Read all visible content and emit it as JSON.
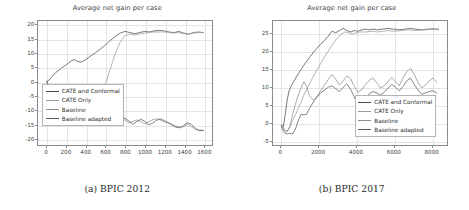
{
  "figure": {
    "background": "#ffffff",
    "subfigures": [
      {
        "caption": "(a) BPIC 2012",
        "chart_data": {
          "type": "line",
          "title": "Average net gain per case",
          "xlabel": "",
          "ylabel": "",
          "xlim": [
            -90,
            1690
          ],
          "ylim": [
            -22.5,
            21.5
          ],
          "grid": true,
          "legend_position": "lower left",
          "xticks": [
            0,
            200,
            400,
            600,
            800,
            1000,
            1200,
            1400,
            1600
          ],
          "yticks": [
            20,
            15,
            10,
            5,
            0,
            -5,
            -10,
            -15,
            -20
          ],
          "series": [
            {
              "name": "CATE and Conformal",
              "color": "#4a4a4a",
              "x": [
                0,
                25,
                50,
                75,
                100,
                150,
                200,
                250,
                280,
                310,
                350,
                400,
                450,
                500,
                550,
                600,
                650,
                700,
                750,
                800,
                850,
                900,
                950,
                1000,
                1050,
                1100,
                1150,
                1200,
                1250,
                1300,
                1350,
                1400,
                1450,
                1500,
                1550,
                1600
              ],
              "y": [
                0,
                0.6,
                1.6,
                2.6,
                3.4,
                4.8,
                6.0,
                7.4,
                7.8,
                7.2,
                6.9,
                7.8,
                9.1,
                10.3,
                11.6,
                13.0,
                14.6,
                16.0,
                17.2,
                17.8,
                17.4,
                17.0,
                17.4,
                17.8,
                17.6,
                18.0,
                18.2,
                18.0,
                17.6,
                17.4,
                17.8,
                17.2,
                16.8,
                17.4,
                17.6,
                17.4
              ]
            },
            {
              "name": "CATE Only",
              "color": "#9a9a9a",
              "x": [
                0,
                30,
                60,
                100,
                150,
                200,
                250,
                300,
                350,
                400,
                450,
                500,
                550,
                600,
                650,
                700,
                750,
                800,
                850,
                900,
                950,
                1000,
                1050,
                1100,
                1150,
                1200,
                1250,
                1300,
                1350,
                1400,
                1450,
                1500,
                1550,
                1600
              ],
              "y": [
                0,
                -2.0,
                -4.0,
                -6.4,
                -7.6,
                -8.2,
                -8.6,
                -8.9,
                -9.0,
                -9.0,
                -9.4,
                -10.6,
                -6.0,
                -1.0,
                4.5,
                10.0,
                14.0,
                16.4,
                16.8,
                16.6,
                16.9,
                17.2,
                17.4,
                17.6,
                17.6,
                17.6,
                17.4,
                17.2,
                17.4,
                17.0,
                16.8,
                17.2,
                17.4,
                17.4
              ]
            },
            {
              "name": "Baseline",
              "color": "#8c8c8c",
              "x": [
                0,
                40,
                80,
                120,
                160,
                200,
                250,
                300,
                350,
                400,
                450,
                500,
                560,
                620,
                680,
                720,
                760,
                800,
                840,
                880,
                920,
                960,
                1000,
                1040,
                1080,
                1120,
                1160,
                1200,
                1240,
                1280,
                1320,
                1360,
                1400,
                1440,
                1480,
                1520,
                1560,
                1600
              ],
              "y": [
                0,
                -3.2,
                -5.6,
                -6.8,
                -7.4,
                -7.8,
                -8.2,
                -8.4,
                -8.2,
                -8.6,
                -8.8,
                -9.2,
                -13.8,
                -14.2,
                -14.0,
                -13.6,
                -13.2,
                -13.6,
                -14.6,
                -14.2,
                -13.6,
                -14.2,
                -15.0,
                -14.4,
                -13.6,
                -13.2,
                -13.6,
                -14.2,
                -14.6,
                -15.2,
                -15.8,
                -16.2,
                -16.0,
                -15.2,
                -16.0,
                -17.0,
                -17.2,
                -17.2
              ]
            },
            {
              "name": "Baseline adapted",
              "color": "#5a5a5a",
              "x": [
                0,
                40,
                80,
                120,
                160,
                200,
                250,
                300,
                350,
                400,
                450,
                500,
                560,
                620,
                680,
                720,
                760,
                800,
                840,
                880,
                920,
                960,
                1000,
                1040,
                1080,
                1120,
                1160,
                1200,
                1240,
                1280,
                1320,
                1360,
                1400,
                1440,
                1480,
                1520,
                1560,
                1600
              ],
              "y": [
                0,
                -3.6,
                -6.0,
                -7.2,
                -7.8,
                -8.2,
                -8.6,
                -8.8,
                -8.6,
                -9.0,
                -9.2,
                -9.6,
                -14.2,
                -14.8,
                -14.6,
                -14.0,
                -13.4,
                -13.0,
                -14.0,
                -15.2,
                -14.2,
                -13.4,
                -14.0,
                -15.4,
                -14.8,
                -13.8,
                -13.2,
                -13.8,
                -14.6,
                -15.4,
                -16.2,
                -16.4,
                -15.6,
                -14.6,
                -15.2,
                -16.6,
                -17.4,
                -17.4
              ]
            }
          ]
        }
      },
      {
        "caption": "(b) BPIC 2017",
        "chart_data": {
          "type": "line",
          "title": "Average net gain per case",
          "xlabel": "",
          "ylabel": "",
          "xlim": [
            -450,
            8850
          ],
          "ylim": [
            -6.5,
            28.5
          ],
          "grid": true,
          "legend_position": "lower right",
          "xticks": [
            0,
            2000,
            4000,
            6000,
            8000
          ],
          "yticks": [
            25,
            20,
            15,
            10,
            5,
            0,
            -5
          ],
          "series": [
            {
              "name": "CATE and Conformal",
              "color": "#4a4a4a",
              "x": [
                0,
                100,
                200,
                300,
                400,
                500,
                700,
                900,
                1100,
                1300,
                1500,
                1700,
                1900,
                2100,
                2300,
                2500,
                2700,
                2900,
                3100,
                3300,
                3500,
                3700,
                3900,
                4100,
                4300,
                4500,
                4700,
                4900,
                5100,
                5400,
                5700,
                6000,
                6300,
                6600,
                6900,
                7200,
                7500,
                7800,
                8100,
                8400
              ],
              "y": [
                -1.0,
                -1.4,
                2.0,
                6.0,
                8.6,
                10.0,
                11.8,
                13.6,
                15.2,
                16.8,
                18.2,
                19.6,
                20.8,
                22.0,
                23.0,
                24.2,
                25.6,
                25.2,
                25.8,
                26.4,
                25.8,
                25.4,
                25.8,
                25.6,
                26.0,
                26.2,
                26.0,
                26.2,
                26.0,
                26.2,
                26.4,
                26.2,
                26.0,
                26.2,
                26.4,
                26.2,
                26.0,
                26.2,
                26.3,
                26.2
              ]
            },
            {
              "name": "CATE Only",
              "color": "#9a9a9a",
              "x": [
                0,
                150,
                300,
                450,
                600,
                800,
                1000,
                1200,
                1400,
                1600,
                1800,
                2000,
                2200,
                2400,
                2600,
                2800,
                3000,
                3200,
                3400,
                3600,
                3800,
                4000,
                4200,
                4500,
                4800,
                5100,
                5400,
                5700,
                6000,
                6400,
                6800,
                7200,
                7600,
                8000,
                8400
              ],
              "y": [
                -1.2,
                -2.4,
                -2.8,
                -1.6,
                0.4,
                2.6,
                5.0,
                7.6,
                9.8,
                11.8,
                13.8,
                15.6,
                17.4,
                19.2,
                20.8,
                22.4,
                23.8,
                24.8,
                25.4,
                25.2,
                24.8,
                25.2,
                25.4,
                25.4,
                25.6,
                25.4,
                25.6,
                25.8,
                25.6,
                25.8,
                26.0,
                25.8,
                26.0,
                26.1,
                26.0
              ]
            },
            {
              "name": "Baseline",
              "color": "#8c8c8c",
              "x": [
                0,
                150,
                300,
                450,
                600,
                750,
                900,
                1050,
                1200,
                1350,
                1500,
                1700,
                1900,
                2100,
                2300,
                2500,
                2700,
                2900,
                3100,
                3300,
                3500,
                3700,
                3900,
                4100,
                4300,
                4500,
                4700,
                4900,
                5100,
                5300,
                5500,
                5700,
                5900,
                6100,
                6300,
                6500,
                6700,
                6900,
                7100,
                7300,
                7500,
                7700,
                7900,
                8100,
                8300
              ],
              "y": [
                -0.6,
                -2.0,
                -2.6,
                -1.2,
                2.2,
                5.0,
                7.6,
                9.6,
                11.4,
                10.0,
                7.4,
                6.2,
                7.2,
                8.8,
                10.4,
                12.0,
                13.4,
                12.0,
                10.4,
                11.6,
                13.0,
                12.2,
                10.0,
                8.4,
                9.2,
                10.6,
                11.8,
                12.4,
                11.0,
                9.6,
                10.2,
                11.4,
                12.6,
                11.4,
                10.2,
                12.4,
                14.2,
                15.2,
                13.4,
                11.2,
                9.6,
                10.4,
                11.6,
                12.4,
                11.2
              ]
            },
            {
              "name": "Baseline adapted",
              "color": "#5a5a5a",
              "x": [
                0,
                150,
                300,
                450,
                600,
                750,
                900,
                1050,
                1200,
                1350,
                1500,
                1700,
                1900,
                2100,
                2300,
                2500,
                2700,
                2900,
                3100,
                3300,
                3500,
                3700,
                3900,
                4100,
                4300,
                4500,
                4700,
                4900,
                5100,
                5300,
                5500,
                5700,
                5900,
                6100,
                6300,
                6500,
                6700,
                6900,
                7100,
                7300,
                7500,
                7700,
                7900,
                8100,
                8300
              ],
              "y": [
                -1.4,
                -3.0,
                -3.4,
                -3.2,
                -3.4,
                -2.0,
                0.4,
                2.2,
                2.0,
                2.2,
                3.8,
                5.6,
                7.0,
                8.2,
                9.0,
                9.8,
                10.2,
                9.4,
                8.6,
                9.8,
                10.8,
                9.2,
                7.0,
                4.6,
                3.2,
                6.0,
                8.0,
                8.6,
                8.2,
                7.6,
                8.4,
                9.6,
                10.6,
                9.8,
                8.8,
                10.0,
                11.6,
                12.4,
                10.6,
                9.0,
                7.8,
                8.2,
                8.6,
                8.8,
                8.2
              ]
            }
          ]
        }
      }
    ]
  }
}
